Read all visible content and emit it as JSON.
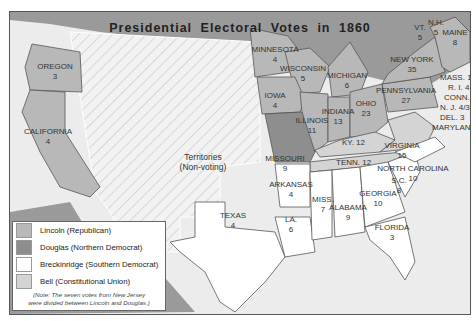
{
  "title": "Presidential Electoral Votes in 1860",
  "colors": {
    "lincoln": "#b8b8b8",
    "douglas": "#8e8e8e",
    "breckinridge": "#ffffff",
    "bell": "#d4d4d4",
    "territories": "#efefef",
    "foreign": "#9a9a9a",
    "water": "#ececec"
  },
  "territories": {
    "line1": "Territories",
    "line2": "(Non-voting)"
  },
  "legend": {
    "items": [
      {
        "label": "Lincoln (Republican)",
        "key": "lincoln"
      },
      {
        "label": "Douglas (Northern Democrat)",
        "key": "douglas"
      },
      {
        "label": "Breckinridge (Southern Democrat)",
        "key": "breckinridge"
      },
      {
        "label": "Bell (Constitutional Union)",
        "key": "bell"
      }
    ],
    "note_line1": "(Note: The seven votes from New Jersey",
    "note_line2": "were divided between Lincoln and Douglas.)"
  },
  "states": [
    {
      "name": "OREGON",
      "votes": "3",
      "candidate": "lincoln"
    },
    {
      "name": "CALIFORNIA",
      "votes": "4",
      "candidate": "lincoln"
    },
    {
      "name": "MINNESOTA",
      "votes": "4",
      "candidate": "lincoln"
    },
    {
      "name": "WISCONSIN",
      "votes": "5",
      "candidate": "lincoln"
    },
    {
      "name": "MICHIGAN",
      "votes": "6",
      "candidate": "lincoln"
    },
    {
      "name": "IOWA",
      "votes": "4",
      "candidate": "lincoln"
    },
    {
      "name": "ILLINOIS",
      "votes": "11",
      "candidate": "lincoln"
    },
    {
      "name": "INDIANA",
      "votes": "13",
      "candidate": "lincoln"
    },
    {
      "name": "OHIO",
      "votes": "23",
      "candidate": "lincoln"
    },
    {
      "name": "NEW YORK",
      "votes": "35",
      "candidate": "lincoln"
    },
    {
      "name": "PENNSYLVANIA",
      "votes": "27",
      "candidate": "lincoln"
    },
    {
      "name": "VT.",
      "votes": "5",
      "candidate": "lincoln"
    },
    {
      "name": "N.H.",
      "votes": "5",
      "candidate": "lincoln"
    },
    {
      "name": "MAINE",
      "votes": "8",
      "candidate": "lincoln"
    },
    {
      "name": "MASS.",
      "votes": "13",
      "candidate": "lincoln"
    },
    {
      "name": "R. I.",
      "votes": "4",
      "candidate": "lincoln"
    },
    {
      "name": "CONN.",
      "votes": "6",
      "candidate": "lincoln"
    },
    {
      "name": "N. J.",
      "votes": "4/3",
      "candidate": "lincoln/douglas"
    },
    {
      "name": "MISSOURI",
      "votes": "9",
      "candidate": "douglas"
    },
    {
      "name": "KY.",
      "votes": "12",
      "candidate": "bell"
    },
    {
      "name": "TENN.",
      "votes": "12",
      "candidate": "bell"
    },
    {
      "name": "VIRGINIA",
      "votes": "15",
      "candidate": "bell"
    },
    {
      "name": "DEL.",
      "votes": "3",
      "candidate": "breckinridge"
    },
    {
      "name": "MARYLAND",
      "votes": "8",
      "candidate": "breckinridge"
    },
    {
      "name": "NORTH CAROLINA",
      "votes": "10",
      "candidate": "breckinridge"
    },
    {
      "name": "S.C.",
      "votes": "8",
      "candidate": "breckinridge"
    },
    {
      "name": "GEORGIA",
      "votes": "10",
      "candidate": "breckinridge"
    },
    {
      "name": "FLORIDA",
      "votes": "3",
      "candidate": "breckinridge"
    },
    {
      "name": "ALABAMA",
      "votes": "9",
      "candidate": "breckinridge"
    },
    {
      "name": "MISS.",
      "votes": "7",
      "candidate": "breckinridge"
    },
    {
      "name": "LA.",
      "votes": "6",
      "candidate": "breckinridge"
    },
    {
      "name": "ARKANSAS",
      "votes": "4",
      "candidate": "breckinridge"
    },
    {
      "name": "TEXAS",
      "votes": "4",
      "candidate": "breckinridge"
    }
  ]
}
